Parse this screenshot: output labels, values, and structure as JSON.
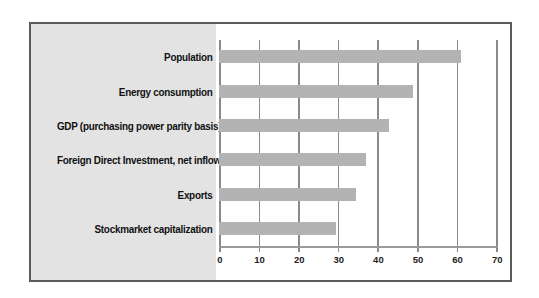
{
  "chart_data": {
    "type": "bar",
    "orientation": "horizontal",
    "title": "",
    "xlabel": "",
    "ylabel": "",
    "categories": [
      "Population",
      "Energy consumption",
      "GDP (purchasing power parity basis)",
      "Foreign Direct Investment, net inflows",
      "Exports",
      "Stockmarket capitalization"
    ],
    "values": [
      61,
      49,
      43,
      37,
      34.5,
      29.5
    ],
    "xlim": [
      0,
      70
    ],
    "xticks": [
      "0",
      "10",
      "20",
      "30",
      "40",
      "50",
      "60",
      "70"
    ],
    "grid": true,
    "legend": null,
    "colors": {
      "bar": "#b3b3b3",
      "label_panel": "#e3e3e3",
      "frame": "#5a5a5a",
      "gridline": "#8a8a8a"
    }
  }
}
